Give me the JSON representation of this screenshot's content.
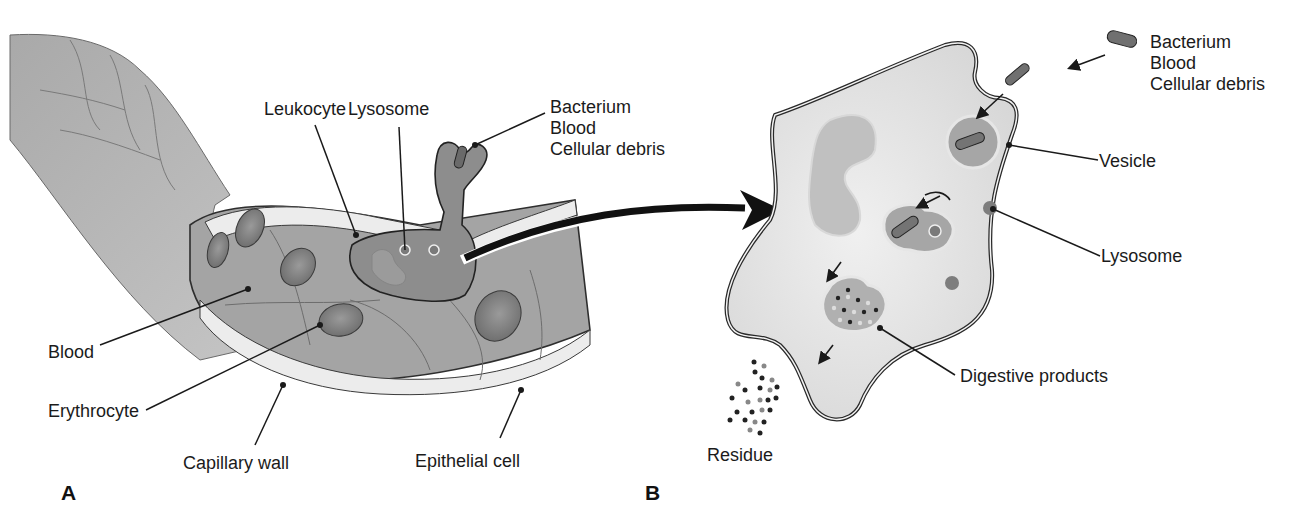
{
  "figure": {
    "panels": [
      {
        "id": "A",
        "letter": "A",
        "subject": "Capillary cross-section with leukocyte engulfing a particle",
        "labels": {
          "leukocyte": "Leukocyte",
          "lysosome": "Lysosome",
          "particle_lines": [
            "Bacterium",
            "Blood",
            "Cellular debris"
          ],
          "blood": "Blood",
          "erythrocyte": "Erythrocyte",
          "capillary_wall": "Capillary wall",
          "epithelial_cell": "Epithelial cell"
        }
      },
      {
        "id": "B",
        "letter": "B",
        "subject": "Enlarged leukocyte showing phagocytosis and digestion",
        "labels": {
          "particle_lines": [
            "Bacterium",
            "Blood",
            "Cellular debris"
          ],
          "vesicle": "Vesicle",
          "lysosome": "Lysosome",
          "digestive_products": "Digestive products",
          "residue": "Residue"
        }
      }
    ],
    "colors": {
      "capillary_outer": "#9e9e9e",
      "capillary_inner": "#a8a8a8",
      "wall_light": "#e6e6e6",
      "erythrocyte": "#7a7a7a",
      "leukocyte": "#8f8f8f",
      "cell_body": "#e2e2e2",
      "nucleus": "#bdbdbd",
      "outline": "#2a2a2a",
      "leader_line": "#1a1a1a"
    }
  }
}
